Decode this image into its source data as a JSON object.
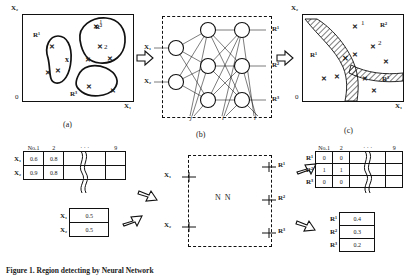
{
  "figure": {
    "caption": "Figure 1. Region detecting by Neural Network",
    "panels": [
      {
        "id": "a",
        "label": "(a)"
      },
      {
        "id": "b",
        "label": "(b)"
      },
      {
        "id": "c",
        "label": "(c)"
      }
    ]
  },
  "panel_a": {
    "axis_y": "X₂",
    "axis_x": "X₁",
    "origin": "0",
    "blobs": [
      {
        "name": "upper-right-blob",
        "label": "R²",
        "points": 6,
        "index_labels": [
          "1",
          "2"
        ]
      },
      {
        "name": "left-blob",
        "label": "R¹",
        "points": 3
      },
      {
        "name": "lower-blob",
        "label": "R³",
        "points": 2
      }
    ],
    "stray_point": "x"
  },
  "panel_b": {
    "inputs": [
      "X₁",
      "X₂"
    ],
    "outputs": [
      "R¹",
      "R²",
      "R³"
    ],
    "layer_labels": [
      "j",
      "i",
      "l"
    ],
    "hidden_layers": 2,
    "nodes_per_hidden_layer": 3
  },
  "panel_c": {
    "axis_y": "X₂",
    "axis_x": "X₁",
    "origin": "0",
    "region_labels": [
      "R¹",
      "R²",
      "R³"
    ],
    "point_indices": [
      "1",
      "2"
    ]
  },
  "bottom": {
    "input_table": {
      "header_prefix": "No.",
      "columns": [
        "1",
        "2",
        "",
        "",
        "9"
      ],
      "ellipsis": "· · ·",
      "last_col": "9",
      "rows": [
        {
          "label": "X₁",
          "values": [
            "0.6",
            "0.8"
          ]
        },
        {
          "label": "X₂",
          "values": [
            "0.9",
            "0.8"
          ]
        }
      ]
    },
    "single_input_table": {
      "rows": [
        {
          "label": "X₁",
          "value": "0.5"
        },
        {
          "label": "X₂",
          "value": "0.5"
        }
      ]
    },
    "nn_block": {
      "title": "N N",
      "inputs": [
        "X₁",
        "X₂"
      ],
      "outputs": [
        "R¹",
        "R²",
        "R³"
      ]
    },
    "output_table": {
      "header_prefix": "No.",
      "columns": [
        "1",
        "2"
      ],
      "ellipsis": "· · ·",
      "last_col": "9",
      "rows": [
        {
          "label": "R¹",
          "values": [
            "0",
            "0"
          ]
        },
        {
          "label": "R²",
          "values": [
            "1",
            "1"
          ]
        },
        {
          "label": "R³",
          "values": [
            "0",
            "0"
          ]
        }
      ]
    },
    "single_output_table": {
      "rows": [
        {
          "label": "R¹",
          "value": "0.4"
        },
        {
          "label": "R²",
          "value": "0.3"
        },
        {
          "label": "R³",
          "value": "0.2"
        }
      ]
    }
  },
  "colors": {
    "ink": "#111111",
    "paper": "#ffffff"
  }
}
